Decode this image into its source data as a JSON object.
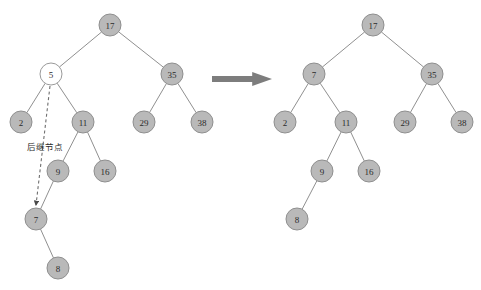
{
  "figure": {
    "background_color": "#ffffff",
    "node_fill_color": "#b9b9b9",
    "node_stroke_color": "#8f8f8f",
    "node_hollow_fill_color": "#ffffff",
    "edge_color": "#909090",
    "arrow_color": "#7d7d7d",
    "dashed_arrow_color": "#6e6e6e",
    "node_radius": 11
  },
  "annotation": {
    "successor_label": "后继节点",
    "successor_label_x": 45,
    "successor_label_y": 147,
    "dashed_arrow": {
      "from_x": 50,
      "from_y": 86,
      "to_x": 36,
      "to_y": 205
    }
  },
  "transform_arrow": {
    "name": "transform-arrow",
    "x": 212,
    "y": 72,
    "width": 60,
    "height": 14
  },
  "left_tree": {
    "caption": "Before deletion",
    "nodes": [
      {
        "id": "L17",
        "value": "17",
        "x": 110,
        "y": 25,
        "hollow": false
      },
      {
        "id": "L5",
        "value": "5",
        "x": 51,
        "y": 74,
        "hollow": true
      },
      {
        "id": "L35",
        "value": "35",
        "x": 172,
        "y": 74,
        "hollow": false
      },
      {
        "id": "L2",
        "value": "2",
        "x": 21,
        "y": 122,
        "hollow": false
      },
      {
        "id": "L11",
        "value": "11",
        "x": 83,
        "y": 122,
        "hollow": false
      },
      {
        "id": "L29",
        "value": "29",
        "x": 144,
        "y": 122,
        "hollow": false
      },
      {
        "id": "L38",
        "value": "38",
        "x": 202,
        "y": 122,
        "hollow": false
      },
      {
        "id": "L9",
        "value": "9",
        "x": 58,
        "y": 171,
        "hollow": false
      },
      {
        "id": "L16",
        "value": "16",
        "x": 105,
        "y": 171,
        "hollow": false
      },
      {
        "id": "L7",
        "value": "7",
        "x": 36,
        "y": 219,
        "hollow": false
      },
      {
        "id": "L8",
        "value": "8",
        "x": 58,
        "y": 268,
        "hollow": false
      }
    ],
    "edges": [
      {
        "from": "L17",
        "to": "L5"
      },
      {
        "from": "L17",
        "to": "L35"
      },
      {
        "from": "L5",
        "to": "L2"
      },
      {
        "from": "L5",
        "to": "L11"
      },
      {
        "from": "L35",
        "to": "L29"
      },
      {
        "from": "L35",
        "to": "L38"
      },
      {
        "from": "L11",
        "to": "L9"
      },
      {
        "from": "L11",
        "to": "L16"
      },
      {
        "from": "L9",
        "to": "L7"
      },
      {
        "from": "L7",
        "to": "L8"
      }
    ]
  },
  "right_tree": {
    "caption": "After deletion",
    "nodes": [
      {
        "id": "R17",
        "value": "17",
        "x": 373,
        "y": 25,
        "hollow": false
      },
      {
        "id": "R7",
        "value": "7",
        "x": 314,
        "y": 74,
        "hollow": false
      },
      {
        "id": "R35",
        "value": "35",
        "x": 432,
        "y": 74,
        "hollow": false
      },
      {
        "id": "R2",
        "value": "2",
        "x": 285,
        "y": 122,
        "hollow": false
      },
      {
        "id": "R11",
        "value": "11",
        "x": 346,
        "y": 122,
        "hollow": false
      },
      {
        "id": "R29",
        "value": "29",
        "x": 405,
        "y": 122,
        "hollow": false
      },
      {
        "id": "R38",
        "value": "38",
        "x": 462,
        "y": 122,
        "hollow": false
      },
      {
        "id": "R9",
        "value": "9",
        "x": 322,
        "y": 171,
        "hollow": false
      },
      {
        "id": "R16",
        "value": "16",
        "x": 369,
        "y": 171,
        "hollow": false
      },
      {
        "id": "R8",
        "value": "8",
        "x": 297,
        "y": 219,
        "hollow": false
      }
    ],
    "edges": [
      {
        "from": "R17",
        "to": "R7"
      },
      {
        "from": "R17",
        "to": "R35"
      },
      {
        "from": "R7",
        "to": "R2"
      },
      {
        "from": "R7",
        "to": "R11"
      },
      {
        "from": "R35",
        "to": "R29"
      },
      {
        "from": "R35",
        "to": "R38"
      },
      {
        "from": "R11",
        "to": "R9"
      },
      {
        "from": "R11",
        "to": "R16"
      },
      {
        "from": "R9",
        "to": "R8"
      }
    ]
  }
}
